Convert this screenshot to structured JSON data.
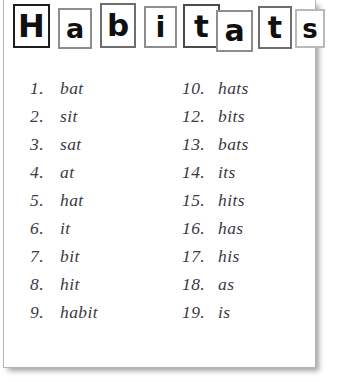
{
  "worksheet": {
    "title_text": "Habitats",
    "title_letters": [
      {
        "char": "H",
        "box_style": "tall-dark"
      },
      {
        "char": "a",
        "box_style": "short-grey"
      },
      {
        "char": "b",
        "box_style": "tall-grey"
      },
      {
        "char": "i",
        "box_style": "mid-grey"
      },
      {
        "char": "t",
        "box_style": "mid-dark"
      },
      {
        "char": "a",
        "box_style": "short-grey"
      },
      {
        "char": "t",
        "box_style": "mid-grey"
      },
      {
        "char": "s",
        "box_style": "short-light"
      }
    ],
    "columns": {
      "left": [
        {
          "number": "1.",
          "word": "bat"
        },
        {
          "number": "2.",
          "word": "sit"
        },
        {
          "number": "3.",
          "word": "sat"
        },
        {
          "number": "4.",
          "word": "at"
        },
        {
          "number": "5.",
          "word": "hat"
        },
        {
          "number": "6.",
          "word": "it"
        },
        {
          "number": "7.",
          "word": "bit"
        },
        {
          "number": "8.",
          "word": "hit"
        },
        {
          "number": "9.",
          "word": "habit"
        }
      ],
      "right": [
        {
          "number": "10.",
          "word": "hats"
        },
        {
          "number": "12.",
          "word": "bits"
        },
        {
          "number": "13.",
          "word": "bats"
        },
        {
          "number": "14.",
          "word": "its"
        },
        {
          "number": "15.",
          "word": "hits"
        },
        {
          "number": "16.",
          "word": "has"
        },
        {
          "number": "17.",
          "word": "his"
        },
        {
          "number": "18.",
          "word": "as"
        },
        {
          "number": "19.",
          "word": "is"
        }
      ]
    },
    "colors": {
      "paper": "#ffffff",
      "ink": "#3a3a42",
      "title_ink": "#101010",
      "box_border_dark": "#1d1d1d",
      "box_border_grey": "#8d8d8d",
      "box_border_light": "#b9b9b9",
      "sheet_border": "#b4b4b4"
    }
  }
}
